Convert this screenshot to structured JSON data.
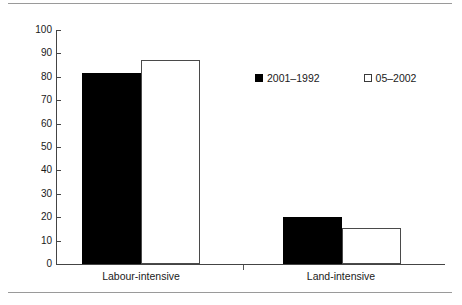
{
  "chart_data": {
    "type": "bar",
    "title": "",
    "subtitle": "",
    "xlabel": "",
    "ylabel": "",
    "categories": [
      "Labour-intensive",
      "Land-intensive"
    ],
    "series": [
      {
        "name": "2001–1992",
        "marker": "filled-square",
        "color": "#000000",
        "values": [
          81.5,
          20
        ]
      },
      {
        "name": "05–2002",
        "marker": "hollow-square",
        "color": "#ffffff",
        "values": [
          87,
          15.5
        ]
      }
    ],
    "ylim": [
      0,
      100
    ],
    "yticks": [
      0,
      10,
      20,
      30,
      40,
      50,
      60,
      70,
      80,
      90,
      100
    ],
    "ytick_labels": [
      "0",
      "10",
      "20",
      "30",
      "40",
      "50",
      "60",
      "70",
      "80",
      "90",
      "100"
    ],
    "grid": false,
    "legend_position": "upper-center"
  },
  "legend": {
    "items": [
      {
        "label": "2001–1992",
        "swatch": "filled-square"
      },
      {
        "label": "05–2002",
        "swatch": "hollow-square"
      }
    ]
  },
  "axis": {
    "y_labels": [
      "100",
      "90",
      "80",
      "70",
      "60",
      "50",
      "40",
      "30",
      "20",
      "10",
      "0"
    ],
    "x_labels": [
      "Labour-intensive",
      "Land-intensive"
    ]
  }
}
